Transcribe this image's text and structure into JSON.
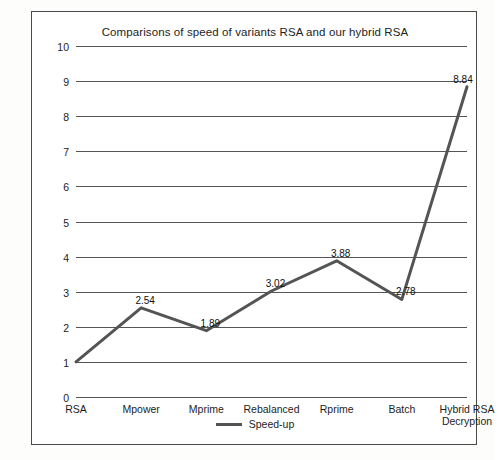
{
  "chart_data": {
    "type": "line",
    "title": "Comparisons of speed of variants RSA and our hybrid RSA",
    "xlabel": "",
    "ylabel": "",
    "ylim": [
      0,
      10
    ],
    "yticks": [
      0,
      1,
      2,
      3,
      4,
      5,
      6,
      7,
      8,
      9,
      10
    ],
    "ytick_labels": [
      "0",
      "1",
      "2",
      "3",
      "4",
      "5",
      "6",
      "7",
      "8",
      "9",
      "10"
    ],
    "grid": "horizontal",
    "legend_position": "bottom-center",
    "categories": [
      "RSA",
      "Mpower",
      "Mprime",
      "Rebalanced",
      "Rprime",
      "Batch",
      "Hybrid RSA Decryption"
    ],
    "category_labels": [
      [
        "RSA"
      ],
      [
        "Mpower"
      ],
      [
        "Mprime"
      ],
      [
        "Rebalanced"
      ],
      [
        "Rprime"
      ],
      [
        "Batch"
      ],
      [
        "Hybrid RSA",
        "Decryption"
      ]
    ],
    "series": [
      {
        "name": "Speed-up",
        "color": "#545454",
        "values": [
          1,
          2.54,
          1.89,
          3.02,
          3.88,
          2.78,
          8.84
        ],
        "data_labels": [
          "",
          "2.54",
          "1.89",
          "3.02",
          "3.88",
          "2.78",
          "8.84"
        ]
      }
    ],
    "legend": [
      "Speed-up"
    ]
  },
  "colors": {
    "series_line": "#545454",
    "gridline": "#555555",
    "frame": "#4a4a4a",
    "text": "#1d1d1d",
    "background": "#ffffff"
  }
}
